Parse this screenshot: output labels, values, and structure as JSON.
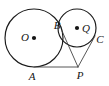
{
  "figure": {
    "background_color": "#ffffff",
    "stroke_color": "#1a1a1a",
    "line_color": "#444444",
    "label_color": "#141414",
    "width": 109,
    "height": 86
  },
  "labels": {
    "center_big": "O",
    "tangency_between_circles": "B",
    "center_small": "Q",
    "tangency_small_right": "C",
    "tangency_big_bottom": "A",
    "external_point": "P"
  },
  "points": {
    "O": {
      "x": 34,
      "y": 38,
      "label_x": 25,
      "label_y": 38
    },
    "Q": {
      "x": 77,
      "y": 28,
      "label_x": 86,
      "label_y": 29
    },
    "B": {
      "x": 62,
      "y": 31,
      "label_x": 57,
      "label_y": 26
    },
    "C": {
      "x": 95,
      "y": 36,
      "label_x": 100,
      "label_y": 40
    },
    "A": {
      "x": 34,
      "y": 67,
      "label_x": 32,
      "label_y": 77
    },
    "P": {
      "x": 78,
      "y": 67,
      "label_x": 80,
      "label_y": 76
    }
  },
  "circles": {
    "big": {
      "cx": 34,
      "cy": 38,
      "r": 29
    },
    "small": {
      "cx": 77,
      "cy": 28,
      "r": 19
    }
  },
  "segments": [
    {
      "name": "tangent-A-to-P",
      "from": "A",
      "to": "P"
    },
    {
      "name": "tangent-B-to-P",
      "from": "B",
      "to": "P"
    },
    {
      "name": "tangent-C-to-P",
      "from": "C",
      "to": "P"
    }
  ]
}
